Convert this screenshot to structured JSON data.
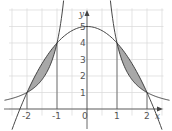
{
  "diagram": {
    "title": "",
    "axes": {
      "x_label": "x",
      "y_label": "y"
    },
    "x_ticks": [
      {
        "v": -2,
        "label": "-2"
      },
      {
        "v": -1,
        "label": "-1"
      },
      {
        "v": 0,
        "label": "0"
      },
      {
        "v": 1,
        "label": "1"
      },
      {
        "v": 2,
        "label": "2"
      }
    ],
    "y_ticks": [
      {
        "v": 1,
        "label": "1"
      },
      {
        "v": 2,
        "label": "2"
      },
      {
        "v": 3,
        "label": "3"
      },
      {
        "v": 4,
        "label": "4"
      },
      {
        "v": 5,
        "label": "5"
      }
    ],
    "curves": [
      {
        "name": "parabola",
        "formula": "y = 5 - x^2"
      },
      {
        "name": "reciprocal-square",
        "formula": "y = 4 / x^2"
      }
    ],
    "shaded_regions": [
      {
        "from": -2,
        "to": -1
      },
      {
        "from": 1,
        "to": 2
      }
    ],
    "intersection_points": [
      [
        -2,
        1
      ],
      [
        -1,
        4
      ],
      [
        1,
        4
      ],
      [
        2,
        1
      ]
    ],
    "colors": {
      "grid": "#d8d8d8",
      "axis": "#444444",
      "curve": "#333333",
      "shade": "#a8a8a8",
      "marker_lines": "#555555"
    }
  }
}
